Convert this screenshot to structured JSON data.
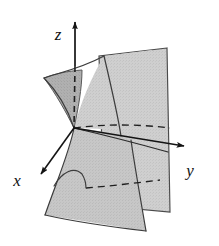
{
  "figure": {
    "width": 219,
    "height": 246,
    "background_color": "#ffffff"
  },
  "axes": {
    "x": {
      "label": "x",
      "direction": "down-left",
      "label_position": {
        "x": 17,
        "y": 184
      },
      "line": {
        "x1": 74,
        "y1": 128,
        "x2": 37,
        "y2": 178
      },
      "arrowhead": true
    },
    "y": {
      "label": "y",
      "direction": "right",
      "label_position": {
        "x": 189,
        "y": 172
      },
      "line": {
        "x1": 74,
        "y1": 128,
        "x2": 191,
        "y2": 147
      },
      "arrowhead": true
    },
    "z": {
      "label": "z",
      "direction": "up",
      "label_position": {
        "x": 61,
        "y": 35
      },
      "line": {
        "x1": 74,
        "y1": 128,
        "x2": 75,
        "y2": 20
      },
      "arrowhead": true,
      "hidden_segment": true
    },
    "origin": {
      "x": 74,
      "y": 128
    }
  },
  "colors": {
    "surface_light": "#d2d2d2",
    "surface_mid": "#c4c4c4",
    "surface_dark": "#a8a8a8",
    "surface_panel": "#cdcdcd",
    "outline": "#3c3c3c",
    "axis": "#141414",
    "curve": "#2a2a2a",
    "hidden_curve": "#1f1f1f",
    "background": "#ffffff"
  },
  "surfaces": [
    {
      "name": "back-vertical-panel",
      "role": "intersecting plane rendered as a tall quadrilateral sheet behind the saddle",
      "fill": "#cdcdcd",
      "corners": [
        {
          "x": 167,
          "y": 48
        },
        {
          "x": 99,
          "y": 56
        },
        {
          "x": 104,
          "y": 206
        },
        {
          "x": 170,
          "y": 212
        }
      ]
    },
    {
      "name": "upper-saddle-sheet",
      "role": "upper half of the saddle surface flaring to the left",
      "fill": "#c9c9c9",
      "shading": "darker along left wing"
    },
    {
      "name": "lower-saddle-sheet",
      "role": "lower half of the saddle surface sweeping down-left",
      "fill": "#c6c6c6",
      "shading": "mid gray"
    },
    {
      "name": "left-wing-shadow",
      "role": "darker shaded lobe at upper-left of the saddle",
      "fill": "#a8a8a8"
    }
  ],
  "curves": [
    {
      "name": "upper-front-ridge",
      "style": "solid",
      "role": "visible silhouette along the top of the upper saddle sheet"
    },
    {
      "name": "throat-curve",
      "style": "solid",
      "role": "waist of the saddle passing through the origin"
    },
    {
      "name": "lower-front-ridge",
      "style": "solid",
      "role": "visible silhouette along the lower saddle sheet"
    },
    {
      "name": "hidden-trace-upper",
      "style": "dashed",
      "role": "hidden cross-section behind the plane near the origin"
    },
    {
      "name": "hidden-trace-lower",
      "style": "dashed",
      "role": "hidden cross-section on the lower sheet"
    },
    {
      "name": "hidden-z-axis",
      "style": "dashed",
      "role": "portion of the z-axis occluded by the surface"
    }
  ]
}
